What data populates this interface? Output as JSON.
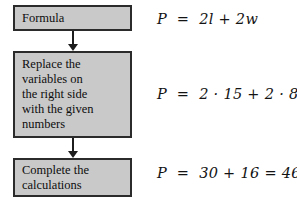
{
  "figure": {
    "type": "flowchart-with-equations",
    "background_color": "#ffffff",
    "box_fill_color": "#c9c9c9",
    "box_border_color": "#2b2b2b",
    "text_color": "#0d0d0d",
    "arrow_color": "#1d1d1d"
  },
  "steps": [
    {
      "id": "formula",
      "label": "Formula",
      "equation": "P  =  2l + 2w"
    },
    {
      "id": "replace",
      "label": "Replace the\nvariables on\nthe right side\nwith the given\nnumbers",
      "equation": "P  =  2 · 15 + 2 · 8"
    },
    {
      "id": "complete",
      "label": "Complete the\ncalculations",
      "equation": "P  =  30 + 16 = 46"
    }
  ],
  "connectors": [
    {
      "id": "arrow-formula-to-replace",
      "direction": "down"
    },
    {
      "id": "arrow-replace-to-complete",
      "direction": "down"
    }
  ]
}
